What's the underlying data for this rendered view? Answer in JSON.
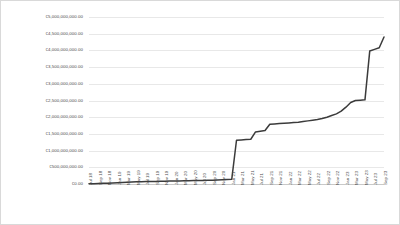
{
  "chart_data": {
    "type": "line",
    "title": "",
    "subtitle": "",
    "xlabel": "",
    "ylabel": "",
    "grid": true,
    "legend": false,
    "legend_position": "none",
    "currency_symbol": "€",
    "series_color": "#3b3b3b",
    "gridline_color": "#e8e8e8",
    "axis_color": "#c9c9c9",
    "frame_color": "#d9d9d9",
    "ylim": [
      0,
      5000000000
    ],
    "ytick_values": [
      0,
      500000000,
      1000000000,
      1500000000,
      2000000000,
      2500000000,
      3000000000,
      3500000000,
      4000000000,
      4500000000,
      5000000000
    ],
    "ytick_labels": [
      "€0.00",
      "€500,000,000.00",
      "€1,000,000,000.00",
      "€1,500,000,000.00",
      "€2,000,000,000.00",
      "€2,500,000,000.00",
      "€3,000,000,000.00",
      "€3,500,000,000.00",
      "€4,000,000,000.00",
      "€4,500,000,000.00",
      "€5,000,000,000.00"
    ],
    "xtick_labels": [
      "Jul 18",
      "Sep 18",
      "Nov 18",
      "Jan 19",
      "Mar 19",
      "May 19",
      "Jul 19",
      "Sep 19",
      "Nov 19",
      "Jan 20",
      "Mar 20",
      "May 20",
      "Jul 20",
      "Sep 20",
      "Nov 20",
      "Jan 21",
      "Mar 21",
      "May 21",
      "Jul 21",
      "Sep 21",
      "Nov 21",
      "Jan 22",
      "Mar 22",
      "May 22",
      "Jul 22",
      "Sep 22",
      "Nov 22",
      "Jan 23",
      "Mar 23",
      "May 23",
      "Jul 23",
      "Sep 23"
    ],
    "categories": [
      "Jul 18",
      "Aug 18",
      "Sep 18",
      "Oct 18",
      "Nov 18",
      "Dec 18",
      "Jan 19",
      "Feb 19",
      "Mar 19",
      "Apr 19",
      "May 19",
      "Jun 19",
      "Jul 19",
      "Aug 19",
      "Sep 19",
      "Oct 19",
      "Nov 19",
      "Dec 19",
      "Jan 20",
      "Feb 20",
      "Mar 20",
      "Apr 20",
      "May 20",
      "Jun 20",
      "Jul 20",
      "Aug 20",
      "Sep 20",
      "Oct 20",
      "Nov 20",
      "Dec 20",
      "Jan 21",
      "Feb 21",
      "Mar 21",
      "Apr 21",
      "May 21",
      "Jun 21",
      "Jul 21",
      "Aug 21",
      "Sep 21",
      "Oct 21",
      "Nov 21",
      "Dec 21",
      "Jan 22",
      "Feb 22",
      "Mar 22",
      "Apr 22",
      "May 22",
      "Jun 22",
      "Jul 22",
      "Aug 22",
      "Sep 22",
      "Oct 22",
      "Nov 22",
      "Dec 22",
      "Jan 23",
      "Feb 23",
      "Mar 23",
      "Apr 23",
      "May 23",
      "Jun 23",
      "Jul 23",
      "Aug 23",
      "Sep 23"
    ],
    "values": [
      5000000,
      9000000,
      14000000,
      20000000,
      26000000,
      33000000,
      40000000,
      48000000,
      55000000,
      60000000,
      64000000,
      68000000,
      72000000,
      75000000,
      78000000,
      81000000,
      84000000,
      87000000,
      90000000,
      93000000,
      96000000,
      99000000,
      102000000,
      105000000,
      108000000,
      112000000,
      116000000,
      120000000,
      126000000,
      132000000,
      140000000,
      1310000000,
      1320000000,
      1330000000,
      1340000000,
      1560000000,
      1580000000,
      1600000000,
      1790000000,
      1800000000,
      1810000000,
      1820000000,
      1830000000,
      1840000000,
      1850000000,
      1870000000,
      1890000000,
      1910000000,
      1930000000,
      1960000000,
      2000000000,
      2050000000,
      2100000000,
      2180000000,
      2300000000,
      2440000000,
      2500000000,
      2510000000,
      2520000000,
      3980000000,
      4030000000,
      4080000000,
      4400000000
    ]
  }
}
